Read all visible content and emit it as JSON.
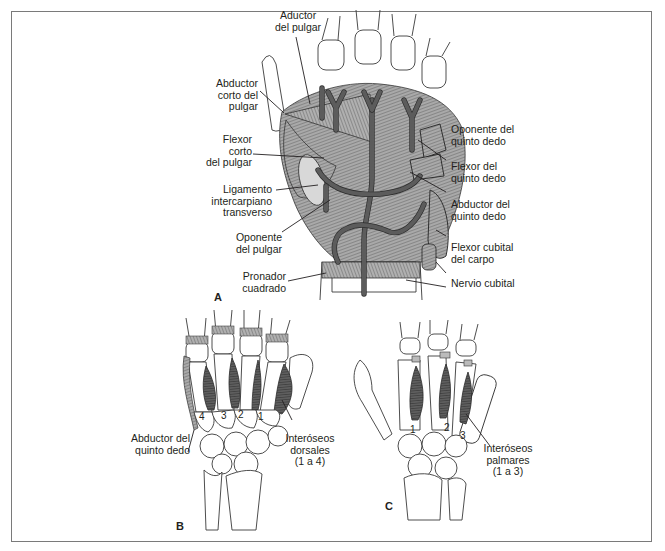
{
  "figure": {
    "panel_a": {
      "letter": "A",
      "labels": {
        "aductor_pulgar": "Aductor\ndel pulgar",
        "abductor_corto_pulgar": "Abductor\ncorto del\npulgar",
        "flexor_corto_pulgar": "Flexor\ncorto\ndel pulgar",
        "ligamento_intercarpiano": "Ligamento\nintercarpiano\ntransverso",
        "oponente_pulgar": "Oponente\ndel pulgar",
        "pronador_cuadrado": "Pronador\ncuadrado",
        "oponente_quinto": "Oponente del\nquinto dedo",
        "flexor_quinto": "Flexor del\nquinto dedo",
        "abductor_quinto": "Abductor del\nquinto dedo",
        "flexor_cubital": "Flexor cubital\ndel carpo",
        "nervio_cubital": "Nervio cubital"
      }
    },
    "panel_b": {
      "letter": "B",
      "labels": {
        "abductor_quinto": "Abductor del\nquinto dedo",
        "interoseos_dorsales": "Interóseos\ndorsales\n(1 a 4)"
      },
      "muscle_numbers": [
        "4",
        "3",
        "2",
        "1"
      ]
    },
    "panel_c": {
      "letter": "C",
      "labels": {
        "interoseos_palmares": "Interóseos\npalmares\n(1 a 3)"
      },
      "muscle_numbers": [
        "1",
        "2",
        "3"
      ]
    }
  },
  "colors": {
    "frame": "#7a7a7a",
    "text": "#231f20",
    "muscle_dark": "#4a4a4a",
    "vessel": "#5c5c5c"
  }
}
